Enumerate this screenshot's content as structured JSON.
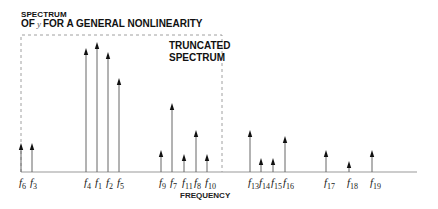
{
  "title": {
    "line1": "SPECTRUM",
    "line2_prefix": "OF",
    "line2_var": "y",
    "line2_suffix": "FOR A GENERAL NONLINEARITY"
  },
  "truncated_label": {
    "line1": "TRUNCATED",
    "line2": "SPECTRUM"
  },
  "xlabel": "FREQUENCY",
  "colors": {
    "ink": "#111111",
    "axis": "#999999",
    "dashed_box": "#888888"
  },
  "chart_data": {
    "type": "stem",
    "xlabel": "FREQUENCY",
    "ylabel": "",
    "annotation": "TRUNCATED SPECTRUM (dashed box enclosing f6 through f10)",
    "categories": [
      "f6",
      "f3",
      "f4",
      "f1",
      "f2",
      "f5",
      "f9",
      "f7",
      "f11",
      "f8",
      "f10",
      "f13",
      "f14",
      "f15",
      "f16",
      "f17",
      "f18",
      "f19"
    ],
    "values": [
      29,
      29,
      124,
      130,
      120,
      94,
      22,
      69,
      18,
      42,
      18,
      42,
      14,
      14,
      36,
      22,
      11,
      22
    ],
    "truncated_range": [
      "f6",
      "f10"
    ]
  },
  "lines": [
    {
      "label": "f",
      "sub": "6",
      "x": 21,
      "top": 143
    },
    {
      "label": "f",
      "sub": "3",
      "x": 32,
      "top": 143
    },
    {
      "label": "f",
      "sub": "4",
      "x": 86,
      "top": 48
    },
    {
      "label": "f",
      "sub": "1",
      "x": 97,
      "top": 42
    },
    {
      "label": "f",
      "sub": "2",
      "x": 108,
      "top": 52
    },
    {
      "label": "f",
      "sub": "5",
      "x": 119,
      "top": 78
    },
    {
      "label": "f",
      "sub": "9",
      "x": 161,
      "top": 150
    },
    {
      "label": "f",
      "sub": "7",
      "x": 172,
      "top": 103
    },
    {
      "label": "f",
      "sub": "11",
      "x": 184,
      "top": 154
    },
    {
      "label": "f",
      "sub": "8",
      "x": 196,
      "top": 130
    },
    {
      "label": "f",
      "sub": "10",
      "x": 207,
      "top": 154
    },
    {
      "label": "f",
      "sub": "13",
      "x": 250,
      "top": 130
    },
    {
      "label": "f",
      "sub": "14",
      "x": 261,
      "top": 158
    },
    {
      "label": "f",
      "sub": "15",
      "x": 273,
      "top": 158
    },
    {
      "label": "f",
      "sub": "16",
      "x": 285,
      "top": 136
    },
    {
      "label": "f",
      "sub": "17",
      "x": 326,
      "top": 150
    },
    {
      "label": "f",
      "sub": "18",
      "x": 349,
      "top": 161
    },
    {
      "label": "f",
      "sub": "19",
      "x": 372,
      "top": 150
    }
  ]
}
